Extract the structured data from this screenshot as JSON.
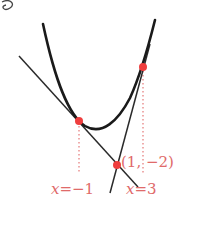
{
  "diagram": {
    "type": "parabola-with-tangent-lines",
    "corner_mark": "⑧",
    "colors": {
      "curve": "#1a1a1a",
      "line": "#2a2a2a",
      "point": "#ef3e3e",
      "guide": "#e88a8a",
      "label": "#e06a6a"
    },
    "points": [
      {
        "name": "tangent-point-left",
        "x": 79,
        "y": 121
      },
      {
        "name": "intersection",
        "x": 117,
        "y": 165,
        "label": "(1, −2)"
      },
      {
        "name": "tangent-point-right",
        "x": 143,
        "y": 67
      }
    ],
    "labels": {
      "intersection": "(1, −2)",
      "left_x_var": "x",
      "left_x_val": "=−1",
      "right_x_var": "x",
      "right_x_val": "=3"
    }
  }
}
